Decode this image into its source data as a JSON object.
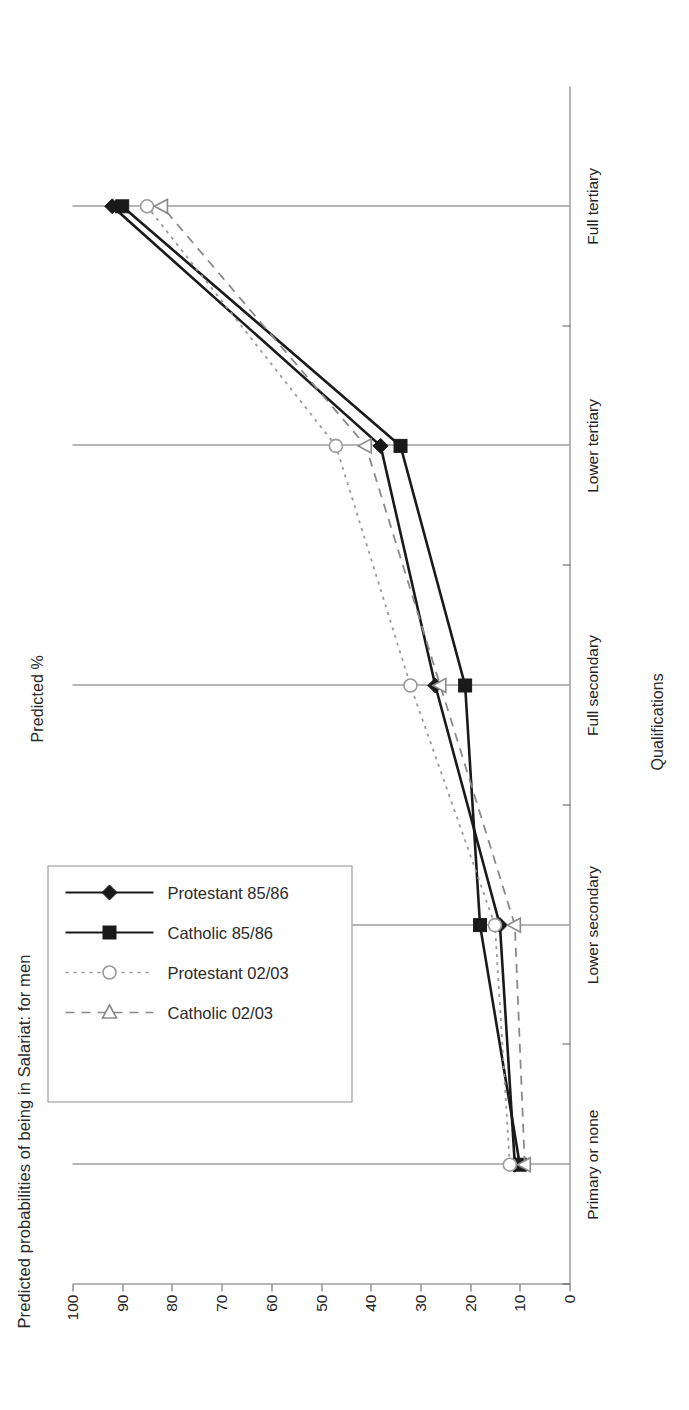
{
  "chart_data": {
    "type": "line",
    "title": "Predicted probabilities of being in Salariat: for men",
    "xlabel": "Qualifications",
    "ylabel": "Predicted %",
    "categories": [
      "Primary or none",
      "Lower secondary",
      "Full secondary",
      "Lower tertiary",
      "Full tertiary"
    ],
    "ylim": [
      0,
      100
    ],
    "yticks": [
      0,
      10,
      20,
      30,
      40,
      50,
      60,
      70,
      80,
      90,
      100
    ],
    "grid": "vertical gridlines at each category",
    "legend_position": "upper right (inside plot, near Full tertiary)",
    "series": [
      {
        "name": "Protestant 85/86",
        "marker": "filled-diamond",
        "line": "solid",
        "color": "#1a1a1a",
        "values": [
          11,
          14,
          27,
          38,
          92
        ]
      },
      {
        "name": "Catholic 85/86",
        "marker": "filled-square",
        "line": "solid",
        "color": "#1a1a1a",
        "values": [
          10,
          18,
          21,
          34,
          90
        ]
      },
      {
        "name": "Protestant 02/03",
        "marker": "open-circle",
        "line": "dotted",
        "color": "#9a9a9a",
        "values": [
          12,
          15,
          32,
          47,
          85
        ]
      },
      {
        "name": "Catholic 02/03",
        "marker": "open-triangle",
        "line": "dashed",
        "color": "#8a8a8a",
        "values": [
          9,
          11,
          26,
          41,
          82
        ]
      }
    ]
  },
  "legend": {
    "entries": [
      {
        "label": "Protestant 85/86"
      },
      {
        "label": "Catholic 85/86"
      },
      {
        "label": "Protestant 02/03"
      },
      {
        "label": "Catholic 02/03"
      }
    ]
  }
}
